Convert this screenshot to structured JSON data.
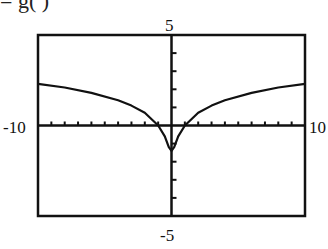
{
  "header": {
    "fragment_text": "=  g(  )"
  },
  "chart_data": {
    "type": "line",
    "title": "",
    "xlabel": "",
    "ylabel": "",
    "xlim": [
      -10,
      10
    ],
    "ylim": [
      -5,
      5
    ],
    "x_tick_labels": {
      "min": "-10",
      "max": "10"
    },
    "y_tick_labels": {
      "min": "-5",
      "max": "5"
    },
    "x_tick_spacing": 1,
    "y_tick_spacing": 1,
    "grid": false,
    "legend": null,
    "series": [
      {
        "name": "f(x)",
        "x": [
          -10,
          -8,
          -6,
          -4,
          -3,
          -2,
          -1,
          -0.5,
          -0.2,
          0,
          0.2,
          0.5,
          1,
          2,
          3,
          4,
          6,
          8,
          10
        ],
        "y": [
          2.3,
          2.1,
          1.8,
          1.4,
          1.1,
          0.7,
          0.0,
          -0.6,
          -1.2,
          -1.4,
          -1.2,
          -0.6,
          0.0,
          0.7,
          1.1,
          1.4,
          1.8,
          2.1,
          2.3
        ]
      }
    ]
  }
}
